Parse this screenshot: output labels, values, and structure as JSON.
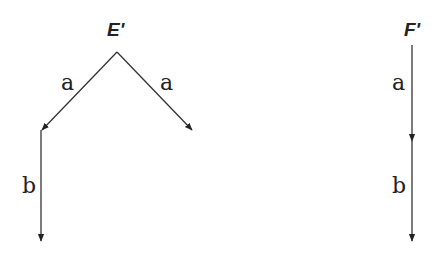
{
  "diagram": {
    "colors": {
      "line": "#333333",
      "text": "#222222",
      "background": "#ffffff"
    },
    "graphs": [
      {
        "name": "E'",
        "label": "E'",
        "edges": [
          {
            "from": "E'",
            "to": "left",
            "label": "a"
          },
          {
            "from": "E'",
            "to": "right",
            "label": "a"
          },
          {
            "from": "left",
            "to": "left-bottom",
            "label": "b"
          }
        ]
      },
      {
        "name": "F'",
        "label": "F'",
        "edges": [
          {
            "from": "F'",
            "to": "middle",
            "label": "a"
          },
          {
            "from": "middle",
            "to": "bottom",
            "label": "b"
          }
        ]
      }
    ]
  }
}
